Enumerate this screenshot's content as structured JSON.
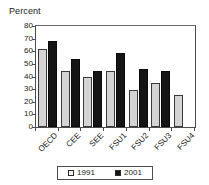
{
  "chart_data": {
    "type": "bar",
    "title": "",
    "ylabel": "Percent",
    "xlabel": "",
    "ylim": [
      0,
      80
    ],
    "ytick_step": 10,
    "yticks": [
      80,
      70,
      60,
      50,
      40,
      30,
      20,
      10,
      0
    ],
    "grid": false,
    "legend_position": "bottom",
    "categories": [
      "OECD",
      "CEE",
      "SEE",
      "FSU1",
      "FSU2",
      "FSU3",
      "FSU4"
    ],
    "series": [
      {
        "name": "1991",
        "color": "#d4d4d4",
        "values": [
          62,
          44,
          40,
          44,
          29.5,
          34.5,
          25.5
        ]
      },
      {
        "name": "2001",
        "color": "#151515",
        "values": [
          68,
          54,
          44,
          59,
          46,
          44,
          null
        ]
      }
    ]
  },
  "legend": {
    "entries": [
      {
        "label": "1991",
        "swatch": "legend-swatch-1991"
      },
      {
        "label": "2001",
        "swatch": "legend-swatch-2001"
      }
    ]
  }
}
